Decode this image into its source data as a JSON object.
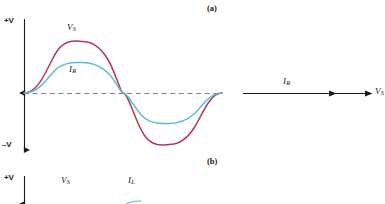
{
  "figure": {
    "title_visible": false,
    "panels": [
      {
        "id": "a",
        "letter": "(a)",
        "x": 207,
        "y": 4
      },
      {
        "id": "b",
        "letter": "(b)",
        "x": 207,
        "y": 157
      }
    ],
    "colors": {
      "source_voltage": "#b23a55",
      "resistive_current": "#5bb9da",
      "axis": "#1a1a1a",
      "zero_line": "#808080",
      "background": "#ffffff",
      "text": "#1a1a1a"
    }
  },
  "panel_a": {
    "axis": {
      "positive_label": "+V",
      "negative_label": "–V",
      "positive_label_x": 4,
      "positive_label_y": 17,
      "negative_label_x": 2,
      "negative_label_y": 141
    },
    "curves": [
      {
        "name": "source-voltage-waveform",
        "label": "V",
        "label_sub": "S",
        "label_x": 67,
        "label_y": 23,
        "color": "#b23a55",
        "amplitude": 52,
        "phase_deg": 0,
        "series_role": "voltage"
      },
      {
        "name": "resistive-current-waveform",
        "label": "I",
        "label_sub": "R",
        "label_x": 69,
        "label_y": 65,
        "color": "#5bb9da",
        "amplitude": 31,
        "phase_deg": 0,
        "series_role": "current"
      }
    ],
    "zero_line": {
      "name": "zero-reference-line",
      "x1": 24,
      "x2": 222,
      "y": 93
    },
    "phasor": {
      "name": "phasor-axis",
      "line_x1": 243,
      "line_x2": 372,
      "line_y": 93,
      "current_label": "I",
      "current_label_sub": "R",
      "current_label_x": 283,
      "current_label_y": 77,
      "voltage_label": "V",
      "voltage_label_sub": "S",
      "voltage_label_x": 375,
      "voltage_label_y": 87,
      "arrowhead_positions": [
        335,
        372
      ]
    }
  },
  "panel_b": {
    "axis": {
      "positive_label": "+V",
      "positive_label_x": 4,
      "positive_label_y": 174
    },
    "curves": [
      {
        "name": "source-voltage-waveform-b",
        "label": "V",
        "label_sub": "S",
        "label_x": 61,
        "label_y": 176,
        "color": "#b23a55"
      },
      {
        "name": "inductive-current-waveform-b",
        "label": "I",
        "label_sub": "L",
        "label_x": 128,
        "label_y": 176,
        "color": "#5bb9da"
      }
    ]
  }
}
